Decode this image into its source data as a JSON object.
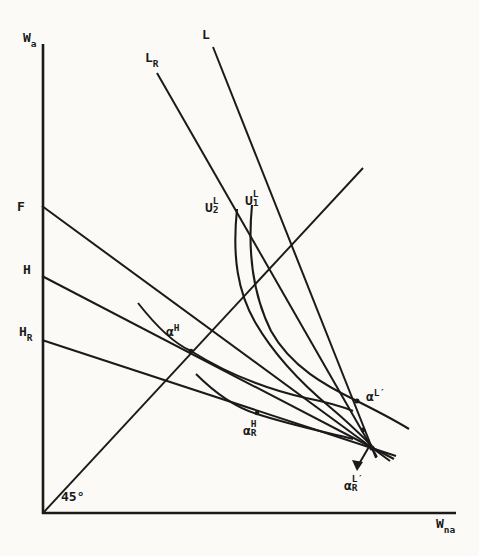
{
  "figure": {
    "type": "economics-wage-diagram",
    "paper_color": "#fbfaf6",
    "ink_color": "#1a1a1a",
    "angle_annotation": "45°",
    "labels": {
      "yAxis": {
        "main": "W",
        "sub": "a"
      },
      "xAxis": {
        "main": "W",
        "sub": "na"
      },
      "angle": {
        "main": "45°"
      },
      "L": {
        "main": "L"
      },
      "LR": {
        "main": "L",
        "sub": "R"
      },
      "F": {
        "main": "F"
      },
      "H": {
        "main": "H"
      },
      "HR": {
        "main": "H",
        "sub": "R"
      },
      "U2L": {
        "main": "U",
        "sup": "L",
        "sub": "2"
      },
      "U1L": {
        "main": "U",
        "sup": "L",
        "sub": "1"
      },
      "alphaH": {
        "main": "α",
        "sup": "H"
      },
      "alphaHR": {
        "main": "α",
        "sup": "H",
        "sub": "R"
      },
      "alphaLp": {
        "main": "α",
        "sup": "L′"
      },
      "alphaLpR": {
        "main": "α",
        "sup": "L′",
        "sub": "R"
      }
    }
  }
}
